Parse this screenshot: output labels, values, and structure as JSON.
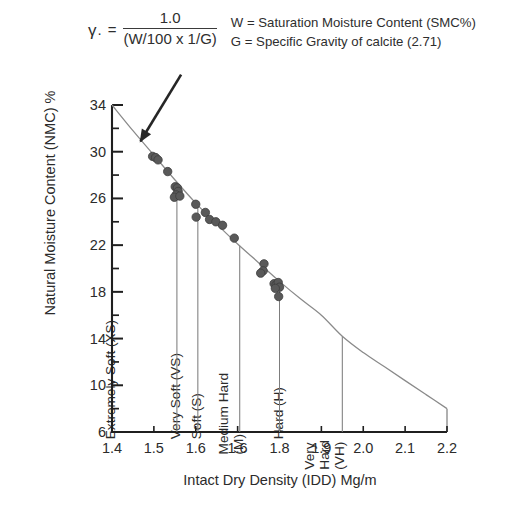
{
  "formula": {
    "gamma_symbol": "γ",
    "gamma_subscript": ".",
    "equals": "=",
    "numerator": "1.0",
    "denominator": "(W/100 x 1/G)",
    "legend_w": "W = Saturation Moisture Content (SMC%)",
    "legend_g": "G = Specific Gravity of calcite (2.71)"
  },
  "chart_data": {
    "type": "scatter",
    "title": "",
    "xlabel": "Intact Dry Density (IDD) Mg/m",
    "ylabel": "Natural Moisture Content (NMC) %",
    "xlim": [
      1.4,
      2.2
    ],
    "ylim": [
      6,
      34
    ],
    "xticks": [
      1.4,
      1.5,
      1.6,
      1.6,
      1.8,
      1.9,
      2.0,
      2.1,
      2.2
    ],
    "xticklabels": [
      "1.4",
      "1.5",
      "1.6",
      "1.6",
      "1.8",
      "1.9",
      "2.0",
      "2.1",
      "2.2"
    ],
    "yticks": [
      6,
      10,
      14,
      18,
      22,
      26,
      30,
      34
    ],
    "yticklabels": [
      "6",
      "10",
      "14",
      "18",
      "22",
      "26",
      "30",
      "34"
    ],
    "y_minor_ticks": [
      8,
      12,
      16,
      20,
      24,
      28,
      32
    ],
    "grid": false,
    "legend_position": "none",
    "curve_name": "Saturation line",
    "curve_color": "#8a8a8a",
    "point_color": "#595959",
    "curve": [
      {
        "x": 1.4,
        "y": 34.0
      },
      {
        "x": 1.45,
        "y": 31.8
      },
      {
        "x": 1.5,
        "y": 29.7
      },
      {
        "x": 1.55,
        "y": 27.6
      },
      {
        "x": 1.6,
        "y": 25.6
      },
      {
        "x": 1.65,
        "y": 23.8
      },
      {
        "x": 1.7,
        "y": 22.1
      },
      {
        "x": 1.75,
        "y": 20.5
      },
      {
        "x": 1.8,
        "y": 18.9
      },
      {
        "x": 1.85,
        "y": 17.4
      },
      {
        "x": 1.9,
        "y": 16.0
      },
      {
        "x": 1.95,
        "y": 14.2
      },
      {
        "x": 2.0,
        "y": 12.8
      },
      {
        "x": 2.05,
        "y": 11.6
      },
      {
        "x": 2.1,
        "y": 10.4
      },
      {
        "x": 2.15,
        "y": 9.2
      },
      {
        "x": 2.2,
        "y": 8.0
      }
    ],
    "points": [
      {
        "x": 1.497,
        "y": 29.6
      },
      {
        "x": 1.504,
        "y": 29.5
      },
      {
        "x": 1.51,
        "y": 29.3
      },
      {
        "x": 1.533,
        "y": 28.3
      },
      {
        "x": 1.551,
        "y": 27.0
      },
      {
        "x": 1.556,
        "y": 26.9
      },
      {
        "x": 1.558,
        "y": 26.6
      },
      {
        "x": 1.553,
        "y": 26.3
      },
      {
        "x": 1.549,
        "y": 26.1
      },
      {
        "x": 1.562,
        "y": 26.2
      },
      {
        "x": 1.6,
        "y": 25.5
      },
      {
        "x": 1.601,
        "y": 24.4
      },
      {
        "x": 1.623,
        "y": 24.8
      },
      {
        "x": 1.633,
        "y": 24.2
      },
      {
        "x": 1.648,
        "y": 24.0
      },
      {
        "x": 1.664,
        "y": 23.7
      },
      {
        "x": 1.692,
        "y": 22.6
      },
      {
        "x": 1.763,
        "y": 20.4
      },
      {
        "x": 1.761,
        "y": 19.8
      },
      {
        "x": 1.755,
        "y": 19.6
      },
      {
        "x": 1.787,
        "y": 18.7
      },
      {
        "x": 1.792,
        "y": 18.6
      },
      {
        "x": 1.797,
        "y": 18.8
      },
      {
        "x": 1.8,
        "y": 18.4
      },
      {
        "x": 1.79,
        "y": 18.3
      },
      {
        "x": 1.798,
        "y": 17.6
      }
    ],
    "bands": [
      {
        "key": "xs",
        "label": "Extremely Soft (XS)",
        "x_start": 1.4,
        "x_end": 1.555
      },
      {
        "key": "vs",
        "label": "Very Soft (VS)",
        "x_start": 1.555,
        "x_end": 1.605
      },
      {
        "key": "s",
        "label": "Soft (S)",
        "x_start": 1.605,
        "x_end": 1.705
      },
      {
        "key": "mh",
        "label": "Medium Hard\n(M)",
        "x_start": 1.705,
        "x_end": 1.8
      },
      {
        "key": "h",
        "label": "Hard (H)",
        "x_start": 1.8,
        "x_end": 1.95
      },
      {
        "key": "vh",
        "label": "Very\nHard\n(VH)",
        "x_start": 1.95,
        "x_end": 2.2
      }
    ],
    "annotation": {
      "text": "",
      "arrow_from": {
        "x": 1.565,
        "y": 36.6
      },
      "arrow_to": {
        "x": 1.468,
        "y": 30.9
      }
    }
  }
}
